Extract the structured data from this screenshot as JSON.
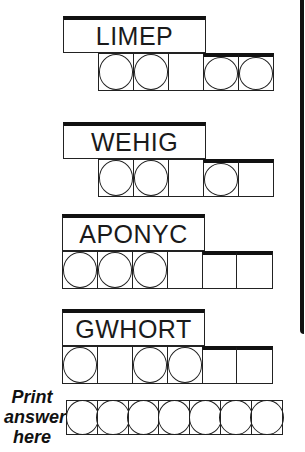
{
  "puzzles": [
    {
      "scrambled": "LIMEP",
      "cells": [
        true,
        true,
        false,
        true,
        true
      ]
    },
    {
      "scrambled": "WEHIG",
      "cells": [
        true,
        true,
        false,
        true,
        false
      ]
    },
    {
      "scrambled": "APONYC",
      "cells": [
        true,
        true,
        true,
        false,
        false,
        false
      ]
    },
    {
      "scrambled": "GWHORT",
      "cells": [
        true,
        false,
        true,
        true,
        false,
        false
      ]
    }
  ],
  "answer": {
    "label_line1": "Print",
    "label_line2": "answer",
    "label_line3": "here",
    "cell_count": 7
  }
}
